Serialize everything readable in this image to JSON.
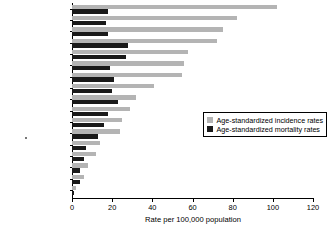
{
  "chart_data": {
    "type": "bar",
    "orientation": "horizontal",
    "title": "",
    "xlabel": "Rate per 100,000 population",
    "ylabel": "",
    "xlim": [
      0,
      120
    ],
    "xticks": [
      0,
      20,
      40,
      60,
      80,
      100,
      120
    ],
    "grid": false,
    "legend_position": "center-right",
    "categories": [
      "USA",
      "Canada",
      "Australia",
      "Sweden",
      "Switzerland",
      "France",
      "Netherlands",
      "UK",
      "Denmark",
      "Brazil",
      "Zimbabwe",
      "Italy",
      "Singapore",
      "Japan",
      "China, Hong Kong",
      "India",
      "China"
    ],
    "series": [
      {
        "name": "Age-standardized incidence rates",
        "color": "#b4b4b4",
        "values": [
          102,
          82,
          75,
          72,
          58,
          56,
          55,
          41,
          32,
          29,
          25,
          24,
          14,
          12,
          8,
          6,
          2
        ]
      },
      {
        "name": "Age-standardized mortality rates",
        "color": "#1a1a1a",
        "values": [
          18,
          17,
          18,
          28,
          27,
          19,
          21,
          20,
          23,
          18,
          16,
          13,
          7,
          6,
          4,
          4,
          1
        ]
      }
    ]
  },
  "legend": {
    "items": [
      {
        "label": "Age-standardized incidence rates",
        "swatch": "incidence"
      },
      {
        "label": "Age-standardized mortality rates",
        "swatch": "mortality"
      }
    ]
  },
  "axis": {
    "x_title": "Rate per 100,000 population"
  }
}
